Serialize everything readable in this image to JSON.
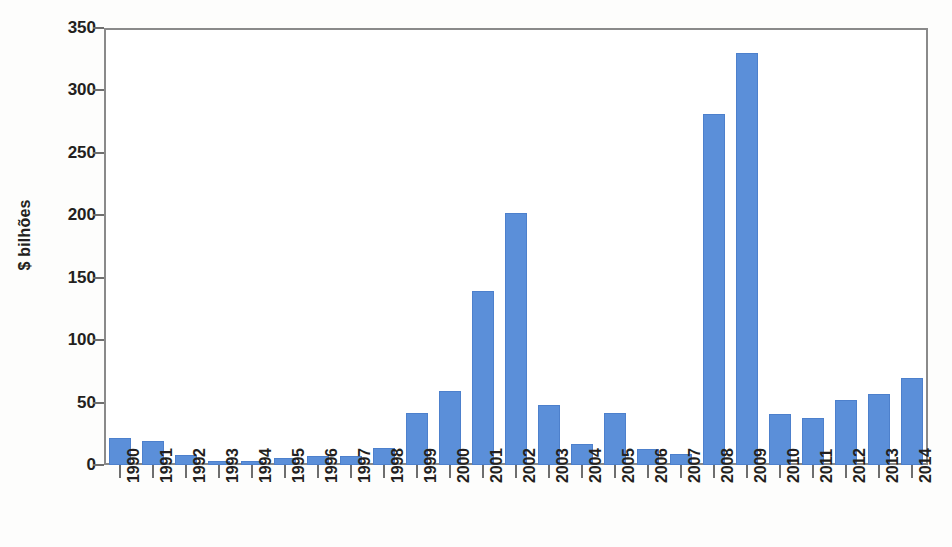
{
  "chart_data": {
    "type": "bar",
    "title": "",
    "subtitle": "",
    "xlabel": "",
    "ylabel": "$ bilhões",
    "ylim": [
      0,
      350
    ],
    "ytick_values": [
      0,
      50,
      100,
      150,
      200,
      250,
      300,
      350
    ],
    "ytick_labels": [
      "0",
      "50",
      "100",
      "150",
      "200",
      "250",
      "300",
      "350"
    ],
    "grid": false,
    "legend": null,
    "series_color": "#5b8fd9",
    "axis_color": "#8a8a8a",
    "categories": [
      "1990",
      "1991",
      "1992",
      "1993",
      "1994",
      "1995",
      "1996",
      "1997",
      "1998",
      "1999",
      "2000",
      "2001",
      "2002",
      "2003",
      "2004",
      "2005",
      "2006",
      "2007",
      "2008",
      "2009",
      "2010",
      "2011",
      "2012",
      "2013",
      "2014"
    ],
    "values": [
      22,
      19,
      8,
      3,
      3.5,
      5.5,
      7,
      7,
      14,
      42,
      59,
      139,
      202,
      48,
      17,
      42,
      12.5,
      9,
      281,
      330,
      41,
      38,
      52,
      57,
      70
    ],
    "series": [
      {
        "name": "",
        "color": "#5b8fd9",
        "values": [
          22,
          19,
          8,
          3,
          3.5,
          5.5,
          7,
          7,
          14,
          42,
          59,
          139,
          202,
          48,
          17,
          42,
          12.5,
          9,
          281,
          330,
          41,
          38,
          52,
          57,
          70
        ]
      }
    ]
  }
}
